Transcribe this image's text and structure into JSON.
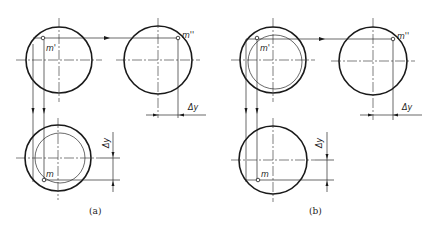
{
  "figure": {
    "panels": [
      {
        "caption": "(a)",
        "labels": {
          "front_point": "m'",
          "side_point": "m''",
          "top_point": "m",
          "dim_side": "Δy",
          "dim_top": "Δy"
        }
      },
      {
        "caption": "(b)",
        "labels": {
          "front_point": "m'",
          "side_point": "m''",
          "top_point": "m",
          "dim_side": "Δy",
          "dim_top": "Δy"
        }
      }
    ]
  }
}
